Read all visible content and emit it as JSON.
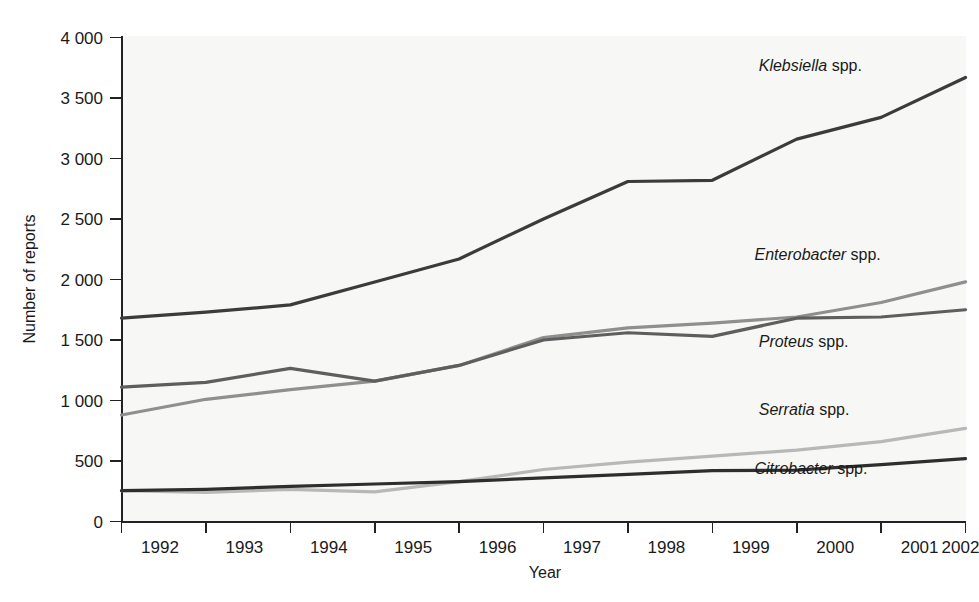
{
  "chart_data": {
    "type": "line",
    "title": "",
    "xlabel": "Year",
    "ylabel": "Number of reports",
    "categories": [
      "1992",
      "1993",
      "1994",
      "1995",
      "1996",
      "1997",
      "1998",
      "1999",
      "2000",
      "2001",
      "2002"
    ],
    "x": [
      1992,
      1993,
      1994,
      1995,
      1996,
      1997,
      1998,
      1999,
      2000,
      2001,
      2002
    ],
    "xlim": [
      1992,
      2002
    ],
    "ylim": [
      0,
      4000
    ],
    "ytick_labels": [
      "0",
      "500",
      "1 000",
      "1 500",
      "2 000",
      "2 500",
      "3 000",
      "3 500",
      "4 000"
    ],
    "yticks": [
      0,
      500,
      1000,
      1500,
      2000,
      2500,
      3000,
      3500,
      4000
    ],
    "grid": false,
    "legend_position": "inline-right-of-series",
    "series": [
      {
        "name": "Klebsiella spp.",
        "genus": "Klebsiella",
        "suffix": " spp.",
        "color": "#3b3b3b",
        "width": 3.2,
        "label_x": 1999.55,
        "label_y": 3720,
        "values": [
          1680,
          1730,
          1790,
          1980,
          2170,
          2500,
          2810,
          2820,
          3160,
          3340,
          3670
        ]
      },
      {
        "name": "Enterobacter spp.",
        "genus": "Enterobacter",
        "suffix": " spp.",
        "color": "#8f8f8f",
        "width": 3.2,
        "label_x": 1999.5,
        "label_y": 2160,
        "values": [
          880,
          1010,
          1090,
          1160,
          1290,
          1520,
          1600,
          1640,
          1690,
          1810,
          1980
        ]
      },
      {
        "name": "Proteus spp.",
        "genus": "Proteus",
        "suffix": " spp.",
        "color": "#5e5e5e",
        "width": 3.2,
        "label_x": 1999.55,
        "label_y": 1440,
        "values": [
          1110,
          1150,
          1265,
          1160,
          1290,
          1500,
          1560,
          1530,
          1680,
          1690,
          1750
        ]
      },
      {
        "name": "Serratia spp.",
        "genus": "Serratia",
        "suffix": " spp.",
        "color": "#b8b8b8",
        "width": 3.2,
        "label_x": 1999.55,
        "label_y": 880,
        "values": [
          255,
          240,
          265,
          245,
          330,
          430,
          490,
          540,
          590,
          660,
          770
        ]
      },
      {
        "name": "Citrobacter spp.",
        "genus": "Citrobacter",
        "suffix": " spp.",
        "color": "#2e2e2e",
        "width": 3.2,
        "label_x": 1999.5,
        "label_y": 395,
        "values": [
          255,
          265,
          290,
          310,
          330,
          360,
          390,
          420,
          425,
          470,
          520
        ]
      }
    ]
  },
  "axes": {
    "y_axis_title": "Number of reports",
    "x_axis_title": "Year"
  },
  "colors": {
    "axis": "#222222",
    "background": "#ffffff",
    "plot_background": "#f7f7f5",
    "text": "#1a1a1a"
  }
}
